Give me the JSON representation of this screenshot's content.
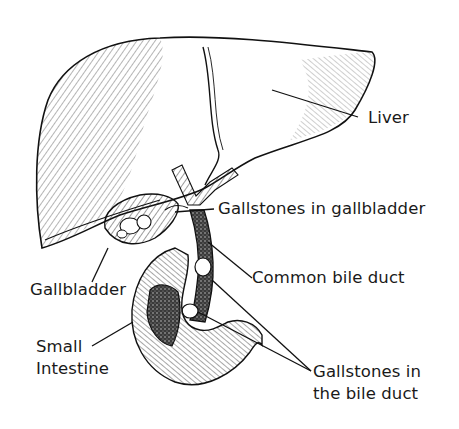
{
  "diagram": {
    "style": "black-and-white pen illustration",
    "labels": {
      "liver": "Liver",
      "gallstones_gallbladder": "Gallstones in gallbladder",
      "common_bile_duct": "Common bile duct",
      "gallbladder": "Gallbladder",
      "small_intestine_line1": "Small",
      "small_intestine_line2": "Intestine",
      "gallstones_duct_line1": "Gallstones in",
      "gallstones_duct_line2": "the bile duct"
    },
    "colors": {
      "ink": "#1a1a1a",
      "background": "#ffffff",
      "duct_fill": "#555555"
    }
  }
}
